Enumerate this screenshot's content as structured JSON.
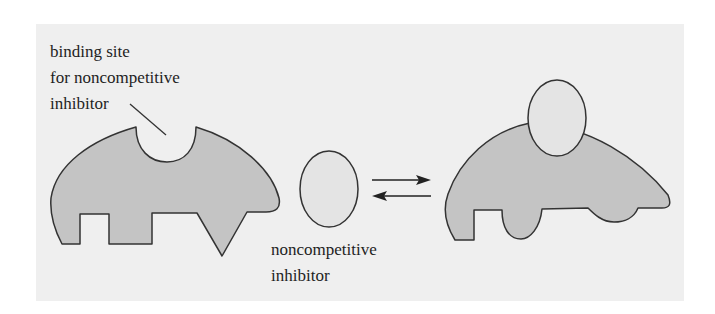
{
  "diagram": {
    "labels": {
      "binding_site": [
        "binding site",
        "for noncompetitive",
        "inhibitor"
      ],
      "inhibitor": [
        "noncompetitive",
        "inhibitor"
      ]
    },
    "elements": {
      "enzyme_free": "enzyme with empty binding site for noncompetitive inhibitor",
      "inhibitor_molecule": "noncompetitive inhibitor (oval)",
      "equilibrium": "reversible reaction arrows",
      "enzyme_inhibitor_complex": "enzyme with bound inhibitor, altered active site"
    },
    "colors": {
      "panel": "#efefef",
      "enzyme_fill": "#c4c4c4",
      "inhibitor_fill": "#e4e4e4",
      "stroke": "#333333"
    }
  }
}
